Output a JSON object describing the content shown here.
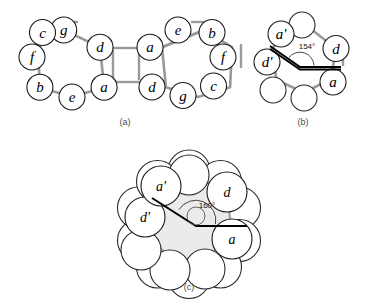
{
  "figure": {
    "background_color": "#ffffff",
    "outline_color": "#1a1a1a",
    "bond_color": "#9a9a9a",
    "core_fill": "#eceaea",
    "angle_arm_color": "#000000"
  },
  "panels": [
    {
      "id": "a",
      "caption": "(a)",
      "caption_pos": {
        "x": 125,
        "y": 125
      },
      "description": "Two fused seven-membered rings of spheres",
      "rings": [
        {
          "name": "left-ring",
          "center": {
            "x": 72,
            "y": 63
          },
          "radius": 34,
          "sphere_radius": 13,
          "start_angle_deg": -104,
          "labels": [
            "g",
            "d",
            "a",
            "e",
            "b",
            "f",
            "c"
          ]
        },
        {
          "name": "right-ring",
          "center": {
            "x": 196,
            "y": 63
          },
          "radius": 34,
          "sphere_radius": 13,
          "start_angle_deg": -76,
          "labels": [
            "e",
            "b",
            "f",
            "c",
            "g",
            "d",
            "a"
          ]
        }
      ]
    },
    {
      "id": "b",
      "caption": "(b)",
      "caption_pos": {
        "x": 303,
        "y": 125
      },
      "description": "Single seven-membered ring with interior angle annotation",
      "ring": {
        "name": "heptagon-ring",
        "center": {
          "x": 304,
          "y": 62
        },
        "radius": 34,
        "sphere_radius": 13,
        "start_angle_deg": -77,
        "labels": [
          "",
          "d",
          "a",
          "",
          "",
          "d'",
          "a'"
        ]
      },
      "angle": {
        "value": "154°",
        "label_pos": {
          "x": 307,
          "y": 46
        },
        "vertex": {
          "x": 300,
          "y": 67
        },
        "arm_a_end": {
          "x": 270,
          "y": 49
        },
        "arm_b_end": {
          "x": 340,
          "y": 67
        }
      }
    },
    {
      "id": "c",
      "caption": "(c)",
      "caption_pos": {
        "x": 189,
        "y": 290
      },
      "description": "Nine-membered ring of overlapping spheres around an inner core with interior angle annotation",
      "ring": {
        "name": "nonagon-ring",
        "center": {
          "x": 189,
          "y": 219
        },
        "radius": 46,
        "sphere_radius": 22,
        "inner_core_radius": 41,
        "start_angle_deg": -90,
        "labels": [
          "",
          "d",
          "a",
          "",
          "",
          "",
          "d'",
          "a'",
          ""
        ]
      },
      "angle": {
        "value": "160°",
        "label_pos": {
          "x": 207,
          "y": 205
        },
        "vertex": {
          "x": 196,
          "y": 225
        },
        "arm_a_end": {
          "x": 155,
          "y": 200
        },
        "arm_b_end": {
          "x": 246,
          "y": 227
        }
      }
    }
  ],
  "labels_legend": {
    "plain": [
      "a",
      "b",
      "c",
      "d",
      "e",
      "f",
      "g"
    ],
    "primed": [
      "a'",
      "d'"
    ]
  }
}
